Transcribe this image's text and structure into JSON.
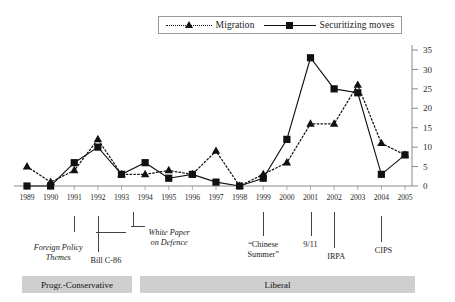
{
  "legend": {
    "items": [
      {
        "label": "Migration",
        "marker": "triangle-marker",
        "line": "dotted",
        "color": "#111111"
      },
      {
        "label": "Securitizing moves",
        "marker": "square-marker",
        "line": "solid",
        "color": "#111111"
      }
    ]
  },
  "chart_data": {
    "type": "line",
    "title": "",
    "xlabel": "",
    "ylabel": "",
    "ylim": [
      0,
      35
    ],
    "ytick_step": 5,
    "yticks": [
      0,
      5,
      10,
      15,
      20,
      25,
      30,
      35
    ],
    "grid": false,
    "legend_position": "top-center",
    "y_axis_side": "right",
    "categories": [
      "1989",
      "1990",
      "1991",
      "1992",
      "1993",
      "1994",
      "1995",
      "1996",
      "1997",
      "1998",
      "1999",
      "2000",
      "2001",
      "2002",
      "2003",
      "2004",
      "2005"
    ],
    "series": [
      {
        "name": "Migration",
        "marker": "triangle",
        "linestyle": "dotted",
        "values": [
          5,
          1,
          4,
          12,
          3,
          3,
          4,
          3,
          9,
          0,
          3,
          6,
          16,
          16,
          26,
          11,
          8
        ]
      },
      {
        "name": "Securitizing moves",
        "marker": "square",
        "linestyle": "solid",
        "values": [
          0,
          0,
          6,
          10,
          3,
          6,
          2,
          3,
          1,
          0,
          2,
          12,
          33,
          25,
          24,
          3,
          8
        ]
      }
    ],
    "annotations": [
      {
        "name": "foreign-policy-themes",
        "label": "Foreign Policy\nThemes",
        "year": "1991",
        "italic": true
      },
      {
        "name": "bill-c-86",
        "label": "Bill C-86",
        "year": "1992",
        "italic": false
      },
      {
        "name": "white-paper-on-defence",
        "label": "White Paper\non Defence",
        "year": "1994",
        "italic": true
      },
      {
        "name": "chinese-summer",
        "label": "“Chinese\nSummer”",
        "year": "1999",
        "italic": false
      },
      {
        "name": "nine-eleven",
        "label": "9/11",
        "year": "2001",
        "italic": false
      },
      {
        "name": "irpa",
        "label": "IRPA",
        "year": "2002",
        "italic": false
      },
      {
        "name": "cips",
        "label": "CIPS",
        "year": "2004",
        "italic": false
      }
    ],
    "government_periods": [
      {
        "label": "Progr.-Conservative",
        "start": "1989",
        "end": "1993"
      },
      {
        "label": "Liberal",
        "start": "1993",
        "end": "2005"
      }
    ]
  }
}
